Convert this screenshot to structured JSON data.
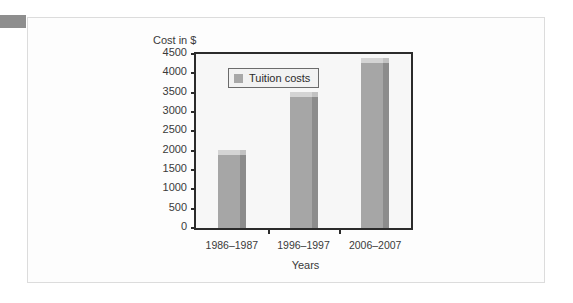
{
  "chart_data": {
    "type": "bar",
    "title": "",
    "ylabel": "Cost in $",
    "xlabel": "Years",
    "categories": [
      "1986–1987",
      "1996–1997",
      "2006–2007"
    ],
    "series": [
      {
        "name": "Tuition costs",
        "values": [
          1880,
          3390,
          4270
        ]
      }
    ],
    "ylim": [
      0,
      4500
    ],
    "yticks": [
      0,
      500,
      1000,
      1500,
      2000,
      2500,
      3000,
      3500,
      4000,
      4500
    ],
    "ytick_labels": [
      "0",
      "500",
      "1000",
      "1500",
      "2000",
      "2500",
      "3000",
      "3500",
      "4000",
      "4500"
    ],
    "grid": false,
    "legend": {
      "position": "top-left",
      "entries": [
        "Tuition costs"
      ]
    },
    "colors": {
      "bar_front": "#a6a6a6",
      "bar_side": "#8c8c8c",
      "bar_top": "#d4d4d4",
      "plot_background": "#f7f7f7",
      "axis": "#2b2b2b",
      "text": "#3a3a3a",
      "card_background": "#fdfdfd",
      "corner_tab": "#8e8e8e"
    }
  },
  "legend": {
    "swatch_name": "legend-color-swatch",
    "label": "Tuition costs"
  },
  "axes": {
    "y_title": "Cost in $",
    "x_title": "Years"
  }
}
